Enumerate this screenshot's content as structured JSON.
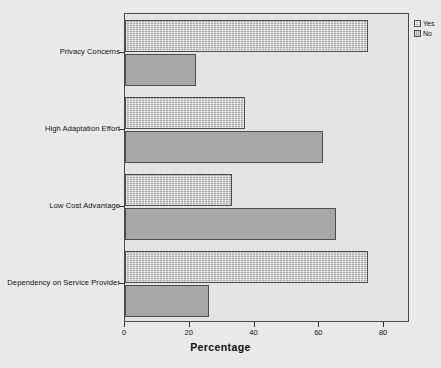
{
  "chart_data": {
    "type": "bar",
    "orientation": "horizontal",
    "title": "",
    "xlabel": "Percentage",
    "ylabel": "",
    "xlim": [
      0,
      88
    ],
    "xticks": [
      0,
      20,
      40,
      60,
      80
    ],
    "xticklabels": [
      "0",
      "20",
      "40",
      "60",
      "80"
    ],
    "grid": false,
    "legend_position": "top-right-outside",
    "categories": [
      "Privacy Concerns",
      "High Adaptation Effort",
      "Low Cost Advantage",
      "Dependency on Service Provider"
    ],
    "series": [
      {
        "name": "Yes",
        "values": [
          75,
          37,
          33,
          75
        ],
        "color": "#a9a9a9",
        "pattern": "dotted-texture"
      },
      {
        "name": "No",
        "values": [
          22,
          61,
          65,
          26
        ],
        "color": "#a8a8a8",
        "pattern": "solid"
      }
    ]
  },
  "legend": {
    "items": [
      {
        "label": "Yes"
      },
      {
        "label": "No"
      }
    ]
  },
  "axis": {
    "x_title": "Percentage",
    "tick_labels": [
      "0",
      "20",
      "40",
      "60",
      "80"
    ]
  },
  "colors": {
    "background": "#e9e9e9",
    "plot_background": "#e4e4e4",
    "bar_border": "#4d4d4d",
    "axis": "#333333",
    "text": "#111111"
  }
}
